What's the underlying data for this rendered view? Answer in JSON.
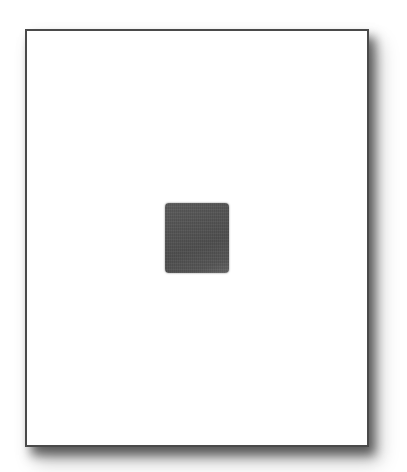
{
  "page": {
    "background_color": "#ffffff",
    "border_color": "#4a4a4a"
  },
  "image_placeholder": {
    "color": "#505050",
    "icon": "image-placeholder-icon"
  }
}
